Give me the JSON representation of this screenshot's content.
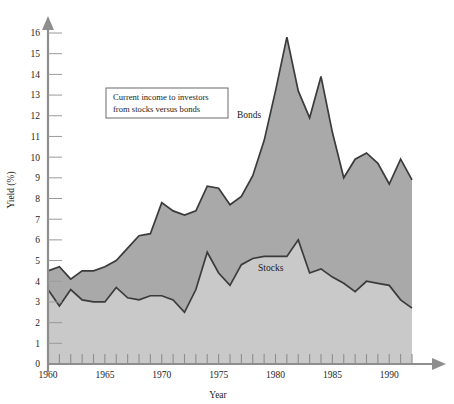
{
  "chart_data": {
    "type": "area",
    "title": "",
    "subtitle": "",
    "xlabel": "Year",
    "ylabel": "Yield (%)",
    "xlim": [
      1960,
      1992
    ],
    "ylim": [
      0,
      16
    ],
    "grid": false,
    "legend_position": "inline-annotations",
    "annotation": {
      "line1": "Current income to investors",
      "line2": "from stocks versus bonds"
    },
    "y_ticks": [
      0,
      1,
      2,
      3,
      4,
      5,
      6,
      7,
      8,
      9,
      10,
      11,
      12,
      13,
      14,
      15,
      16
    ],
    "x_ticks": [
      1960,
      1961,
      1962,
      1963,
      1964,
      1965,
      1966,
      1967,
      1968,
      1969,
      1970,
      1971,
      1972,
      1973,
      1974,
      1975,
      1976,
      1977,
      1978,
      1979,
      1980,
      1981,
      1982,
      1983,
      1984,
      1985,
      1986,
      1987,
      1988,
      1989,
      1990,
      1991,
      1992
    ],
    "x_tick_labels": [
      "1960",
      "",
      "",
      "",
      "",
      "1965",
      "",
      "",
      "",
      "",
      "1970",
      "",
      "",
      "",
      "",
      "1975",
      "",
      "",
      "",
      "",
      "1980",
      "",
      "",
      "",
      "",
      "1985",
      "",
      "",
      "",
      "",
      "1990",
      "",
      ""
    ],
    "x": [
      1960,
      1961,
      1962,
      1963,
      1964,
      1965,
      1966,
      1967,
      1968,
      1969,
      1970,
      1971,
      1972,
      1973,
      1974,
      1975,
      1976,
      1977,
      1978,
      1979,
      1980,
      1981,
      1982,
      1983,
      1984,
      1985,
      1986,
      1987,
      1988,
      1989,
      1990,
      1991,
      1992
    ],
    "series": [
      {
        "name": "Bonds",
        "color": "#a9a9a9",
        "values": [
          4.5,
          4.7,
          4.1,
          4.5,
          4.5,
          4.7,
          5.0,
          5.6,
          6.2,
          6.3,
          7.8,
          7.4,
          7.2,
          7.4,
          8.6,
          8.5,
          7.7,
          8.1,
          9.1,
          10.8,
          13.2,
          15.8,
          13.2,
          11.9,
          13.9,
          11.2,
          9.0,
          9.9,
          10.2,
          9.7,
          8.7,
          9.9,
          8.9
        ]
      },
      {
        "name": "Stocks",
        "color": "#c9c9c9",
        "values": [
          3.6,
          2.8,
          3.6,
          3.1,
          3.0,
          3.0,
          3.7,
          3.2,
          3.1,
          3.3,
          3.3,
          3.1,
          2.5,
          3.6,
          5.4,
          4.4,
          3.8,
          4.8,
          5.1,
          5.2,
          5.2,
          5.2,
          6.0,
          4.4,
          4.6,
          4.2,
          3.9,
          3.5,
          4.0,
          3.9,
          3.8,
          3.1,
          2.7
        ]
      }
    ]
  },
  "axes": {
    "y_axis_name": "yield-axis",
    "x_axis_name": "year-axis"
  }
}
